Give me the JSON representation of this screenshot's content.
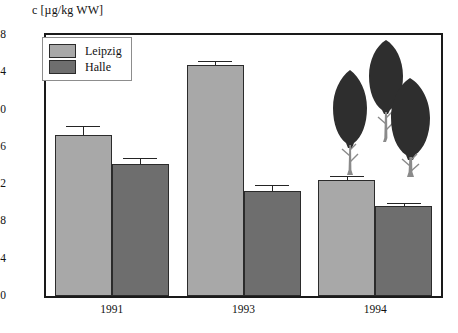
{
  "chart": {
    "axis_title": "c [µg/kg WW]",
    "legend": {
      "items": [
        {
          "label": "Leipzig",
          "color": "#a8a8a8"
        },
        {
          "label": "Halle",
          "color": "#6e6e6e"
        }
      ]
    },
    "decoration": {
      "icon": "three-trees-illustration"
    }
  },
  "chart_data": {
    "type": "bar",
    "title": "",
    "xlabel": "",
    "ylabel": "c [µg/kg WW]",
    "categories": [
      "1991",
      "1993",
      "1994"
    ],
    "series": [
      {
        "name": "Leipzig",
        "color": "#a8a8a8",
        "values": [
          1.73,
          2.48,
          1.24
        ],
        "errors": [
          0.09,
          0.04,
          0.05
        ]
      },
      {
        "name": "Halle",
        "color": "#6e6e6e",
        "values": [
          1.42,
          1.13,
          0.97
        ],
        "errors": [
          0.06,
          0.06,
          0.03
        ]
      }
    ],
    "ylim": [
      0.0,
      2.8
    ],
    "yticks": [
      "0.0",
      "0.4",
      "0.8",
      "1.2",
      "1.6",
      "2.0",
      "2.4",
      "2.8"
    ],
    "ytick_values": [
      0.0,
      0.4,
      0.8,
      1.2,
      1.6,
      2.0,
      2.4,
      2.8
    ],
    "grid": false,
    "legend_position": "top-left",
    "error_bars": true
  }
}
